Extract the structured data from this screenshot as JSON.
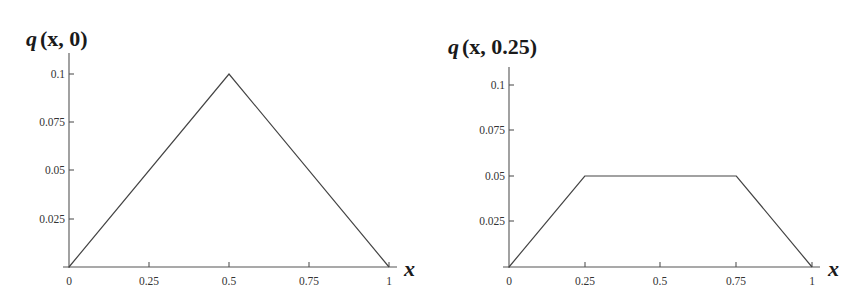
{
  "chart_data": [
    {
      "type": "line",
      "title": "q(x, 0)",
      "title_parts": {
        "fn": "q",
        "args": "(x, 0)"
      },
      "xlabel": "x",
      "ylabel": "",
      "x": [
        0,
        0.5,
        1
      ],
      "series": [
        {
          "name": "q(x, 0)",
          "values": [
            0,
            0.1,
            0
          ]
        }
      ],
      "xticks": [
        "0",
        "0.25",
        "0.5",
        "0.75",
        "1"
      ],
      "yticks": [
        "0.025",
        "0.05",
        "0.075",
        "0.1"
      ],
      "xlim": [
        0,
        1
      ],
      "ylim": [
        0,
        0.11
      ],
      "grid": false,
      "legend": "none"
    },
    {
      "type": "line",
      "title": "q(x, 0.25)",
      "title_parts": {
        "fn": "q",
        "args": "(x, 0.25)"
      },
      "xlabel": "x",
      "ylabel": "",
      "x": [
        0,
        0.25,
        0.75,
        1
      ],
      "series": [
        {
          "name": "q(x, 0.25)",
          "values": [
            0,
            0.05,
            0.05,
            0
          ]
        }
      ],
      "xticks": [
        "0",
        "0.25",
        "0.5",
        "0.75",
        "1"
      ],
      "yticks": [
        "0.025",
        "0.05",
        "0.075",
        "0.1"
      ],
      "xlim": [
        0,
        1
      ],
      "ylim": [
        0,
        0.11
      ],
      "grid": false,
      "legend": "none"
    }
  ],
  "colors": {
    "line": "#444444",
    "axis": "#555555",
    "text": "#1a1a1a"
  }
}
